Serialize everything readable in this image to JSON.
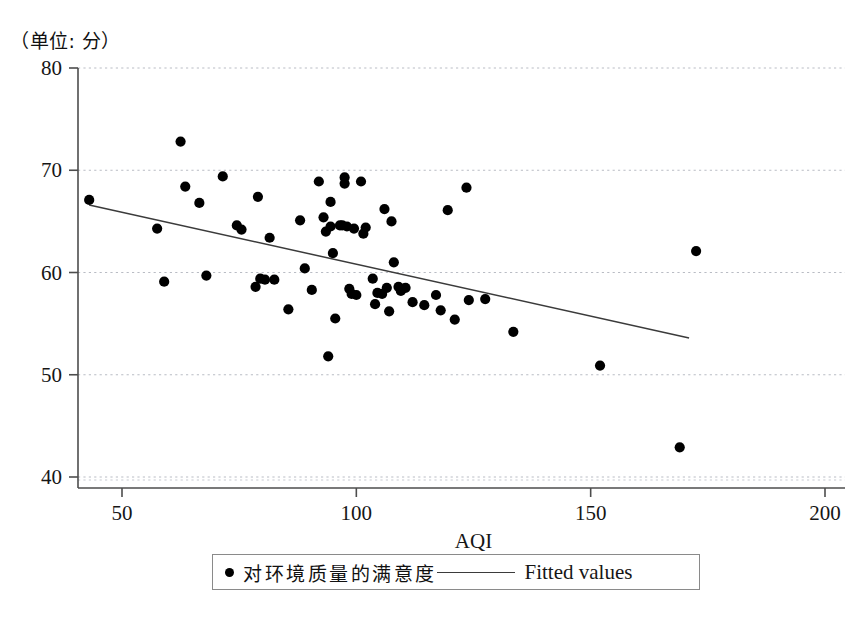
{
  "unit_note": "（单位: 分）",
  "legend": {
    "series_label": "对环境质量的满意度",
    "fit_label": "Fitted values",
    "marker_icon": "filled-circle-icon",
    "line_icon": "solid-line-icon"
  },
  "chart_data": {
    "type": "scatter",
    "title": "",
    "subtitle": "",
    "xlabel": "AQI",
    "ylabel": "",
    "unit_annotation": "（单位: 分）",
    "xlim": [
      38,
      207
    ],
    "ylim": [
      38.5,
      80
    ],
    "xticks": [
      50,
      100,
      150,
      200
    ],
    "yticks": [
      40,
      50,
      60,
      70,
      80
    ],
    "grid": "horizontal-dashed",
    "legend_position": "below-axis",
    "marker_color": "#000000",
    "line_color": "#3b3b3b",
    "series": [
      {
        "name": "对环境质量的满意度",
        "type": "scatter",
        "points": [
          [
            43.0,
            67.1
          ],
          [
            57.5,
            64.3
          ],
          [
            59.0,
            59.1
          ],
          [
            62.5,
            72.8
          ],
          [
            63.5,
            68.4
          ],
          [
            66.5,
            66.8
          ],
          [
            68.0,
            59.7
          ],
          [
            71.5,
            69.4
          ],
          [
            74.5,
            64.6
          ],
          [
            75.5,
            64.2
          ],
          [
            78.5,
            58.6
          ],
          [
            79.0,
            67.4
          ],
          [
            79.5,
            59.4
          ],
          [
            80.5,
            59.3
          ],
          [
            81.5,
            63.4
          ],
          [
            82.5,
            59.3
          ],
          [
            85.5,
            56.4
          ],
          [
            88.0,
            65.1
          ],
          [
            89.0,
            60.4
          ],
          [
            90.5,
            58.3
          ],
          [
            92.0,
            68.9
          ],
          [
            93.0,
            65.4
          ],
          [
            93.5,
            64.0
          ],
          [
            94.0,
            51.8
          ],
          [
            94.5,
            66.9
          ],
          [
            94.5,
            64.5
          ],
          [
            95.0,
            61.9
          ],
          [
            95.5,
            55.5
          ],
          [
            96.5,
            64.6
          ],
          [
            97.0,
            64.6
          ],
          [
            97.5,
            69.3
          ],
          [
            97.5,
            68.7
          ],
          [
            98.0,
            64.5
          ],
          [
            98.5,
            58.4
          ],
          [
            99.0,
            57.9
          ],
          [
            99.5,
            64.3
          ],
          [
            100.0,
            57.8
          ],
          [
            101.0,
            68.9
          ],
          [
            101.5,
            63.8
          ],
          [
            102.0,
            64.4
          ],
          [
            103.5,
            59.4
          ],
          [
            104.0,
            56.9
          ],
          [
            104.5,
            58.0
          ],
          [
            105.5,
            57.9
          ],
          [
            106.0,
            66.2
          ],
          [
            106.5,
            58.5
          ],
          [
            107.0,
            56.2
          ],
          [
            107.5,
            65.0
          ],
          [
            108.0,
            61.0
          ],
          [
            109.0,
            58.6
          ],
          [
            109.5,
            58.2
          ],
          [
            110.5,
            58.5
          ],
          [
            112.0,
            57.1
          ],
          [
            114.5,
            56.8
          ],
          [
            117.0,
            57.8
          ],
          [
            118.0,
            56.3
          ],
          [
            119.5,
            66.1
          ],
          [
            121.0,
            55.4
          ],
          [
            123.5,
            68.3
          ],
          [
            124.0,
            57.3
          ],
          [
            127.5,
            57.4
          ],
          [
            133.5,
            54.2
          ],
          [
            152.0,
            50.9
          ],
          [
            169.0,
            42.9
          ],
          [
            172.5,
            62.1
          ]
        ]
      },
      {
        "name": "Fitted values",
        "type": "line",
        "points": [
          [
            43.0,
            66.6
          ],
          [
            171.0,
            53.6
          ]
        ]
      }
    ]
  },
  "axes": {
    "x_tick_labels": [
      "50",
      "100",
      "150",
      "200"
    ],
    "y_tick_labels": [
      "40",
      "50",
      "60",
      "70",
      "80"
    ],
    "x_axis_title": "AQI"
  }
}
